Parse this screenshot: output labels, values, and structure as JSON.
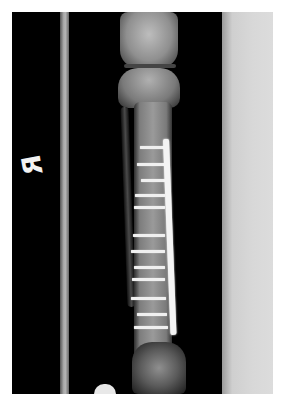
{
  "image": {
    "type": "radiograph",
    "subject": "lower leg (tibia and fibula) anteroposterior view with plate and screw fixation",
    "side_marker": "R",
    "colors": {
      "background": "#000000",
      "bone": "#9a9a9a",
      "hardware": "#f4f4f4",
      "border": "#ffffff"
    },
    "screws": [
      {
        "y": 134,
        "x": 128,
        "w": 25
      },
      {
        "y": 151,
        "x": 125,
        "w": 28
      },
      {
        "y": 167,
        "x": 129,
        "w": 24
      },
      {
        "y": 182,
        "x": 123,
        "w": 30
      },
      {
        "y": 194,
        "x": 122,
        "w": 31
      },
      {
        "y": 222,
        "x": 121,
        "w": 32
      },
      {
        "y": 238,
        "x": 119,
        "w": 34
      },
      {
        "y": 254,
        "x": 122,
        "w": 31
      },
      {
        "y": 266,
        "x": 120,
        "w": 33
      },
      {
        "y": 285,
        "x": 119,
        "w": 35
      },
      {
        "y": 301,
        "x": 125,
        "w": 30
      },
      {
        "y": 314,
        "x": 122,
        "w": 34
      }
    ]
  }
}
